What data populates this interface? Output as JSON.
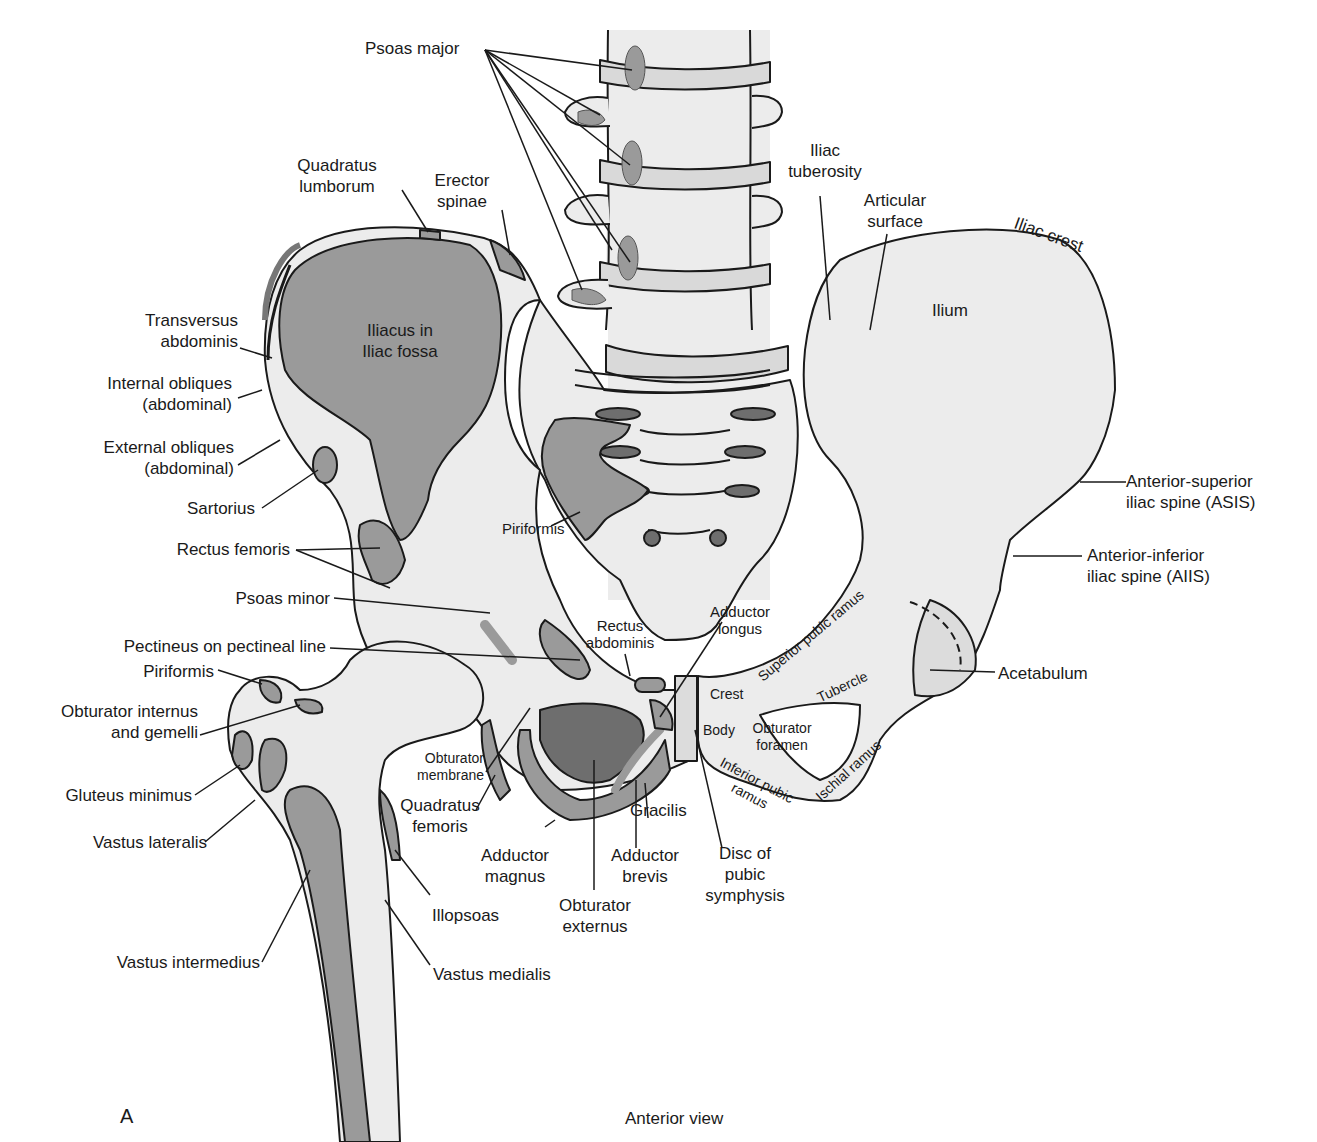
{
  "figure": {
    "panel_letter": "A",
    "view_caption": "Anterior view",
    "colors": {
      "bone": "#ececec",
      "muscle_attachment": "#9a9a9a",
      "dark_foramen": "#6e6e6e",
      "outline": "#1a1a1a",
      "background": "#ffffff"
    }
  },
  "labels": {
    "psoas_major": "Psoas major",
    "quadratus_lumborum_1": "Quadratus",
    "quadratus_lumborum_2": "lumborum",
    "erector_spinae_1": "Erector",
    "erector_spinae_2": "spinae",
    "iliacus_1": "Iliacus in",
    "iliacus_2": "Iliac fossa",
    "transversus_1": "Transversus",
    "transversus_2": "abdominis",
    "internal_obliques_1": "Internal obliques",
    "internal_obliques_2": "(abdominal)",
    "external_obliques_1": "External obliques",
    "external_obliques_2": "(abdominal)",
    "sartorius": "Sartorius",
    "rectus_femoris": "Rectus femoris",
    "psoas_minor": "Psoas minor",
    "pectineus": "Pectineus on pectineal line",
    "piriformis_femur": "Piriformis",
    "obturator_internus_1": "Obturator internus",
    "obturator_internus_2": "and gemelli",
    "gluteus_minimus": "Gluteus minimus",
    "vastus_lateralis": "Vastus lateralis",
    "vastus_intermedius": "Vastus intermedius",
    "vastus_medialis": "Vastus medialis",
    "iliopsoas": "Illopsoas",
    "obturator_membrane_1": "Obturator",
    "obturator_membrane_2": "membrane",
    "quadratus_femoris_1": "Quadratus",
    "quadratus_femoris_2": "femoris",
    "adductor_magnus_1": "Adductor",
    "adductor_magnus_2": "magnus",
    "obturator_externus_1": "Obturator",
    "obturator_externus_2": "externus",
    "adductor_brevis_1": "Adductor",
    "adductor_brevis_2": "brevis",
    "gracilis": "Gracilis",
    "disc_1": "Disc of",
    "disc_2": "pubic",
    "disc_3": "symphysis",
    "piriformis_sacrum": "Piriformis",
    "rectus_abdominis_1": "Rectus",
    "rectus_abdominis_2": "abdominis",
    "adductor_longus_1": "Adductor",
    "adductor_longus_2": "longus",
    "iliac_tuberosity_1": "Iliac",
    "iliac_tuberosity_2": "tuberosity",
    "articular_surface_1": "Articular",
    "articular_surface_2": "surface",
    "iliac_crest": "Iliac crest",
    "ilium": "Ilium",
    "asis_1": "Anterior-superior",
    "asis_2": "iliac spine (ASIS)",
    "aiis_1": "Anterior-inferior",
    "aiis_2": "iliac spine (AIIS)",
    "acetabulum": "Acetabulum",
    "superior_pubic_ramus": "Superior pubic ramus",
    "tubercle": "Tubercle",
    "crest": "Crest",
    "body": "Body",
    "obturator_foramen_1": "Obturator",
    "obturator_foramen_2": "foramen",
    "inferior_pubic_ramus_1": "Inferior pubic",
    "inferior_pubic_ramus_2": "ramus",
    "ischial_ramus": "Ischial ramus"
  }
}
